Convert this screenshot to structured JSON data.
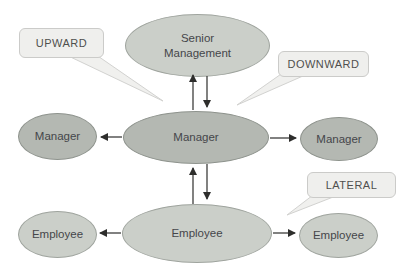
{
  "diagram": {
    "kind": "organizational-communication-flow",
    "background": "#ffffff"
  },
  "nodes": {
    "senior": {
      "label": "Senior Management",
      "tone": "light"
    },
    "manager_center": {
      "label": "Manager",
      "tone": "dark"
    },
    "manager_left": {
      "label": "Manager",
      "tone": "dark"
    },
    "manager_right": {
      "label": "Manager",
      "tone": "dark"
    },
    "employee_center": {
      "label": "Employee",
      "tone": "light"
    },
    "employee_left": {
      "label": "Employee",
      "tone": "light"
    },
    "employee_right": {
      "label": "Employee",
      "tone": "light"
    }
  },
  "callouts": {
    "upward": {
      "label": "UPWARD"
    },
    "downward": {
      "label": "DOWNWARD"
    },
    "lateral": {
      "label": "LATERAL"
    }
  },
  "edges": [
    {
      "from": "Manager (center)",
      "to": "Senior Management",
      "type": "upward"
    },
    {
      "from": "Senior Management",
      "to": "Manager (center)",
      "type": "downward"
    },
    {
      "from": "Employee (center)",
      "to": "Manager (center)",
      "type": "upward"
    },
    {
      "from": "Manager (center)",
      "to": "Employee (center)",
      "type": "downward"
    },
    {
      "from": "Manager (center)",
      "to": "Manager (left)",
      "type": "lateral"
    },
    {
      "from": "Manager (center)",
      "to": "Manager (right)",
      "type": "lateral"
    },
    {
      "from": "Employee (center)",
      "to": "Employee (left)",
      "type": "lateral"
    },
    {
      "from": "Employee (center)",
      "to": "Employee (right)",
      "type": "lateral"
    }
  ],
  "colors": {
    "background": "#ffffff",
    "node_light_fill": "#cbcfc9",
    "node_light_border": "#9fa49e",
    "node_dark_fill": "#b4b8b2",
    "node_dark_border": "#8e938d",
    "callout_fill": "#efefed",
    "callout_border": "#cbcbc9",
    "arrow": "#2e2e2c",
    "text": "#45464a"
  }
}
